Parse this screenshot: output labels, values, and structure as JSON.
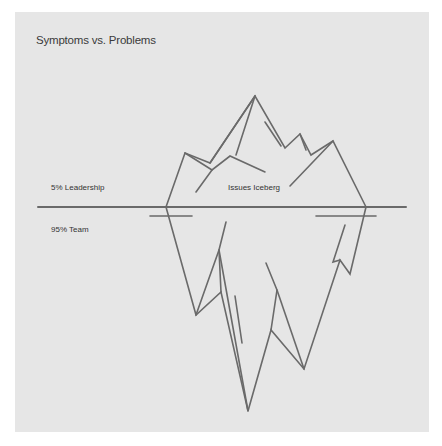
{
  "diagram": {
    "title": "Symptoms vs. Problems",
    "labels": {
      "above_water": "5% Leadership",
      "below_water": "95% Team",
      "iceberg": "Issues Iceberg"
    },
    "colors": {
      "background": "#e6e6e6",
      "line": "#6a6a6a",
      "text": "#333333"
    }
  }
}
